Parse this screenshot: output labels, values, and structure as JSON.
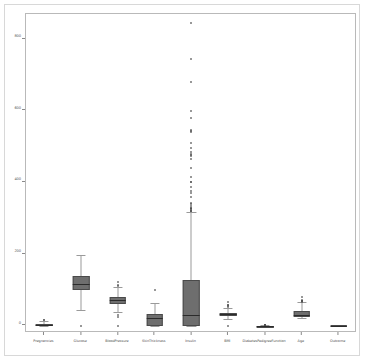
{
  "chart_data": {
    "type": "box",
    "title": "",
    "xlabel": "",
    "ylabel": "",
    "ylim": [
      -20,
      870
    ],
    "grid": false,
    "legend": null,
    "yticks": [
      0,
      200,
      400,
      600,
      800
    ],
    "ytick_labels": [
      "0",
      "200",
      "400",
      "600",
      "800"
    ],
    "categories": [
      "Pregnancies",
      "Glucose",
      "BloodPressure",
      "SkinThickness",
      "Insulin",
      "BMI",
      "DiabetesPedigreeFunction",
      "Age",
      "Outcome"
    ],
    "boxes": [
      {
        "name": "Pregnancies",
        "whisker_low": 0,
        "q1": 1,
        "median": 3,
        "q3": 6,
        "whisker_high": 13,
        "fliers": [
          15,
          17
        ]
      },
      {
        "name": "Glucose",
        "whisker_low": 44,
        "q1": 99,
        "median": 117,
        "q3": 140,
        "whisker_high": 199,
        "fliers": [
          0
        ]
      },
      {
        "name": "BloodPressure",
        "whisker_low": 38,
        "q1": 62,
        "median": 72,
        "q3": 80,
        "whisker_high": 107,
        "fliers": [
          0,
          24,
          30,
          110,
          114,
          122
        ]
      },
      {
        "name": "SkinThickness",
        "whisker_low": 0,
        "q1": 0,
        "median": 23,
        "q3": 32,
        "whisker_high": 63,
        "fliers": [
          99
        ]
      },
      {
        "name": "Insulin",
        "whisker_low": 0,
        "q1": 0,
        "median": 30,
        "q3": 127,
        "whisker_high": 318,
        "fliers": [
          846,
          744,
          680,
          600,
          579,
          545,
          543,
          540,
          510,
          495,
          485,
          480,
          478,
          474,
          465,
          440,
          415,
          402,
          400,
          387,
          375,
          370,
          360,
          342,
          340,
          335,
          330,
          328,
          325,
          325,
          321,
          321,
          320
        ]
      },
      {
        "name": "BMI",
        "whisker_low": 18.2,
        "q1": 27.3,
        "median": 32,
        "q3": 36.6,
        "whisker_high": 50,
        "fliers": [
          0,
          53.2,
          55,
          57.3,
          59.4,
          67.1
        ]
      },
      {
        "name": "DiabetesPedigreeFunction",
        "whisker_low": 0.078,
        "q1": 0.244,
        "median": 0.372,
        "q3": 0.626,
        "whisker_high": 1.19,
        "fliers": [
          1.4,
          1.6,
          1.9,
          2.1,
          2.29,
          2.42
        ]
      },
      {
        "name": "Age",
        "whisker_low": 21,
        "q1": 24,
        "median": 29,
        "q3": 41,
        "whisker_high": 66,
        "fliers": [
          67,
          68,
          69,
          70,
          72,
          81
        ]
      },
      {
        "name": "Outcome",
        "whisker_low": 0,
        "q1": 0,
        "median": 0,
        "q3": 1,
        "whisker_high": 1,
        "fliers": []
      }
    ],
    "colors": {
      "box_face": "#6e6e6e",
      "box_edge": "#4a4a4a",
      "median": "#2b2b2b",
      "whisker": "#9a9a9a",
      "flier": "#4f4f4f",
      "axes_frame": "#b9b9b9",
      "figure_border": "#d8d8d8",
      "background": "#ffffff",
      "tick_label": "#4a4a4a"
    }
  }
}
